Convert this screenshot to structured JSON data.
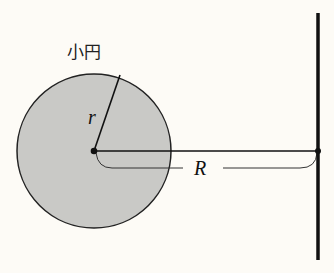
{
  "diagram": {
    "labels": {
      "small_circle": "小円",
      "small_radius": "r",
      "distance": "R"
    },
    "colors": {
      "background": "#fdfbf6",
      "circle_fill": "#c9c9c6",
      "stroke": "#111111"
    },
    "elements": [
      "small circle (shaded) with center point",
      "radius r from center to circumference",
      "horizontal segment from center to vertical wall",
      "bracket indicating distance R",
      "thick vertical line (wall)"
    ]
  }
}
